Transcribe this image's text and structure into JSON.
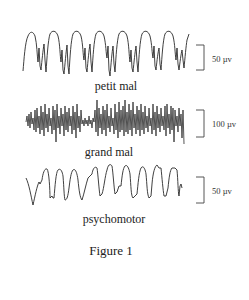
{
  "figure": {
    "caption": "Figure 1",
    "traces": [
      {
        "id": "petit-mal",
        "label": "petit mal",
        "scale_label": "50 µv"
      },
      {
        "id": "grand-mal",
        "label": "grand mal",
        "scale_label": "100 µv"
      },
      {
        "id": "psychomotor",
        "label": "psychomotor",
        "scale_label": "50 µv"
      }
    ]
  },
  "colors": {
    "trace": "#2a2a2a",
    "text": "#222222",
    "background": "#ffffff"
  }
}
